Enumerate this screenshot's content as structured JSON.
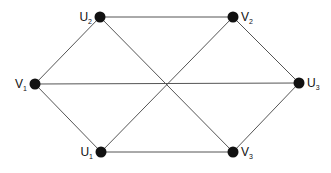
{
  "diagram": {
    "type": "graph",
    "colors": {
      "edge": "#555555",
      "node": "#111111",
      "background": "#ffffff"
    },
    "nodes": [
      {
        "id": "V1",
        "base": "V",
        "sub": "1",
        "x": 35,
        "y": 84,
        "label_side": "left"
      },
      {
        "id": "U2",
        "base": "U",
        "sub": "2",
        "x": 100,
        "y": 17,
        "label_side": "left"
      },
      {
        "id": "V2",
        "base": "V",
        "sub": "2",
        "x": 233,
        "y": 17,
        "label_side": "right"
      },
      {
        "id": "U3",
        "base": "U",
        "sub": "3",
        "x": 299,
        "y": 83,
        "label_side": "right"
      },
      {
        "id": "U1",
        "base": "U",
        "sub": "1",
        "x": 101,
        "y": 152,
        "label_side": "left"
      },
      {
        "id": "V3",
        "base": "V",
        "sub": "3",
        "x": 233,
        "y": 152,
        "label_side": "right"
      }
    ],
    "edges": [
      [
        "U1",
        "V1"
      ],
      [
        "U1",
        "V2"
      ],
      [
        "U1",
        "V3"
      ],
      [
        "U2",
        "V1"
      ],
      [
        "U2",
        "V2"
      ],
      [
        "U2",
        "V3"
      ],
      [
        "U3",
        "V1"
      ],
      [
        "U3",
        "V2"
      ],
      [
        "U3",
        "V3"
      ]
    ]
  }
}
